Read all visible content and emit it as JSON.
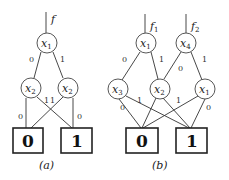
{
  "diagram_a": {
    "caption": "(a)",
    "output": {
      "name": "f",
      "sub": ""
    },
    "nodes": [
      {
        "id": "a1",
        "var": "x",
        "sub": "1"
      },
      {
        "id": "a2",
        "var": "x",
        "sub": "2"
      },
      {
        "id": "a3",
        "var": "x",
        "sub": "2"
      }
    ],
    "edge_labels": [
      "0",
      "1",
      "0",
      "1",
      "1",
      "0"
    ],
    "terminals": [
      "0",
      "1"
    ]
  },
  "diagram_b": {
    "caption": "(b)",
    "outputs": [
      {
        "name": "f",
        "sub": "1"
      },
      {
        "name": "f",
        "sub": "2"
      }
    ],
    "nodes": [
      {
        "id": "b1",
        "var": "x",
        "sub": "1"
      },
      {
        "id": "b2",
        "var": "x",
        "sub": "4"
      },
      {
        "id": "b3",
        "var": "x",
        "sub": "3"
      },
      {
        "id": "b4",
        "var": "x",
        "sub": "2"
      },
      {
        "id": "b5",
        "var": "x",
        "sub": "1"
      }
    ],
    "edge_labels": [
      "0",
      "1",
      "0",
      "1",
      "0",
      "1",
      "1",
      "0"
    ],
    "terminals": [
      "0",
      "1"
    ]
  }
}
